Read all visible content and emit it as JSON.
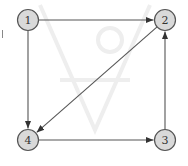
{
  "diagram": {
    "type": "directed-graph",
    "colors": {
      "node_fill": "#d9d9d9",
      "node_stroke": "#555555",
      "edge": "#555555",
      "label": "#333333"
    },
    "nodes": [
      {
        "id": "1",
        "label": "1",
        "x": 28,
        "y": 20
      },
      {
        "id": "2",
        "label": "2",
        "x": 165,
        "y": 20
      },
      {
        "id": "3",
        "label": "3",
        "x": 165,
        "y": 140
      },
      {
        "id": "4",
        "label": "4",
        "x": 28,
        "y": 140
      }
    ],
    "edges": [
      {
        "from": "1",
        "to": "2"
      },
      {
        "from": "1",
        "to": "4"
      },
      {
        "from": "2",
        "to": "4"
      },
      {
        "from": "4",
        "to": "3"
      },
      {
        "from": "3",
        "to": "2"
      }
    ]
  }
}
